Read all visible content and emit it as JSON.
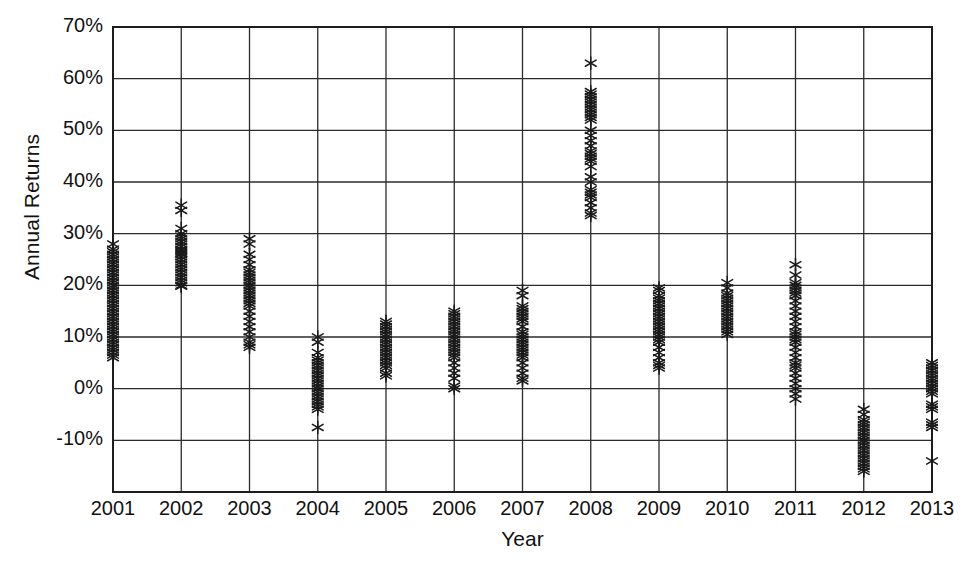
{
  "chart_data": {
    "type": "scatter",
    "title": "",
    "xlabel": "Year",
    "ylabel": "Annual Returns",
    "grid": true,
    "legend": null,
    "marker": "asterisk",
    "marker_color": "#1a1a1a",
    "ylim": [
      -20,
      70
    ],
    "ytick_labels": [
      "70%",
      "60%",
      "50%",
      "40%",
      "30%",
      "20%",
      "10%",
      "0%",
      "-10%"
    ],
    "ytick_values": [
      70,
      60,
      50,
      40,
      30,
      20,
      10,
      0,
      -10
    ],
    "ytick_format": "percent",
    "ytick_step": 10,
    "categories": [
      "2001",
      "2002",
      "2003",
      "2004",
      "2005",
      "2006",
      "2007",
      "2008",
      "2009",
      "2010",
      "2011",
      "2012",
      "2013"
    ],
    "series": [
      {
        "name": "Annual Returns",
        "points_by_category": {
          "2001": [
            28,
            27,
            26.5,
            26,
            25.5,
            25,
            24.5,
            24,
            23.5,
            23,
            22.5,
            22,
            21.5,
            21,
            20.5,
            20,
            19.5,
            19,
            18.5,
            18,
            17.5,
            17,
            16.5,
            16,
            15.5,
            15,
            14.5,
            14,
            13.5,
            13,
            12.5,
            12,
            11.5,
            11,
            10.5,
            10,
            9.5,
            9,
            8.5,
            8,
            7.5,
            7,
            6.5,
            6
          ],
          "2002": [
            35.5,
            34.5,
            31,
            30,
            29.5,
            29,
            28.5,
            28,
            27.5,
            27,
            26.8,
            26.5,
            26.2,
            26,
            25.5,
            25,
            24.5,
            24,
            23.5,
            23,
            22.5,
            22,
            21.5,
            21,
            20.5,
            20,
            19.8
          ],
          "2003": [
            29,
            28,
            26,
            25,
            24,
            23,
            22.5,
            22,
            21.5,
            21,
            20.5,
            20,
            19.5,
            19,
            18.5,
            18,
            17.5,
            17,
            16.5,
            16,
            15,
            14,
            13,
            12,
            11,
            10,
            9,
            8.5,
            8
          ],
          "2004": [
            10,
            9,
            7,
            6,
            5.5,
            5,
            4.5,
            4,
            3.5,
            3,
            2.5,
            2,
            1.5,
            1,
            0.5,
            0,
            -0.5,
            -1,
            -1.5,
            -2,
            -2.5,
            -3,
            -3.5,
            -4,
            -7.5
          ],
          "2005": [
            13,
            12.5,
            12,
            11.5,
            11,
            10.5,
            10,
            9.5,
            9,
            8.5,
            8,
            7.5,
            7,
            6.5,
            6,
            5.5,
            5,
            4.5,
            4,
            3,
            2.5
          ],
          "2006": [
            15,
            14.5,
            14,
            13.5,
            13,
            12.5,
            12,
            11.5,
            11,
            10.5,
            10,
            9.5,
            9,
            8.5,
            8,
            7.5,
            7,
            6.5,
            6,
            5,
            4,
            3,
            2,
            0.5,
            0
          ],
          "2007": [
            19,
            18,
            16,
            15.5,
            15,
            14.5,
            14,
            13.5,
            13,
            12,
            11,
            10.5,
            10,
            9.5,
            9,
            8.5,
            8,
            7.5,
            7,
            6.5,
            6,
            5,
            4,
            3,
            2,
            1.5
          ],
          "2008": [
            63,
            57.5,
            57,
            56.5,
            56,
            55.5,
            55,
            54.5,
            54,
            53.5,
            53,
            52.5,
            52,
            50,
            49,
            48,
            47,
            46,
            45.5,
            45,
            44.5,
            44,
            43,
            41,
            40,
            38.5,
            38,
            37.5,
            37,
            36,
            35,
            34,
            33.5
          ],
          "2009": [
            19.5,
            19,
            18,
            17.5,
            17,
            16.5,
            16,
            15.5,
            15,
            14.5,
            14,
            13.5,
            13,
            12.5,
            12,
            11.5,
            11,
            10.5,
            10,
            9.5,
            9,
            8,
            7,
            6,
            5,
            4.5,
            4
          ],
          "2010": [
            20.5,
            19.5,
            18.5,
            18,
            17.5,
            17,
            16.5,
            16,
            15.5,
            15,
            14.5,
            14,
            13.5,
            13,
            12.5,
            12,
            11.5,
            11,
            10.5
          ],
          "2011": [
            24,
            22,
            20.5,
            20,
            19.5,
            19,
            18.5,
            18,
            17,
            16,
            15,
            14,
            13,
            12,
            11,
            10.5,
            10,
            9.5,
            9,
            8,
            7,
            6,
            5,
            4.5,
            4,
            3,
            2,
            1,
            0,
            -1,
            -2
          ],
          "2012": [
            -4,
            -5,
            -6,
            -6.5,
            -7,
            -7.5,
            -8,
            -8.5,
            -9,
            -9.5,
            -10,
            -10.5,
            -11,
            -11.5,
            -12,
            -12.5,
            -13,
            -13.5,
            -14,
            -14.5,
            -15,
            -15.5,
            -16
          ],
          "2013": [
            5,
            4.5,
            4,
            3.5,
            3,
            2.5,
            2,
            1.5,
            1,
            0.5,
            0,
            -0.5,
            -1,
            -3,
            -3.5,
            -4,
            -6.5,
            -7,
            -7.5,
            -14
          ]
        }
      }
    ]
  }
}
